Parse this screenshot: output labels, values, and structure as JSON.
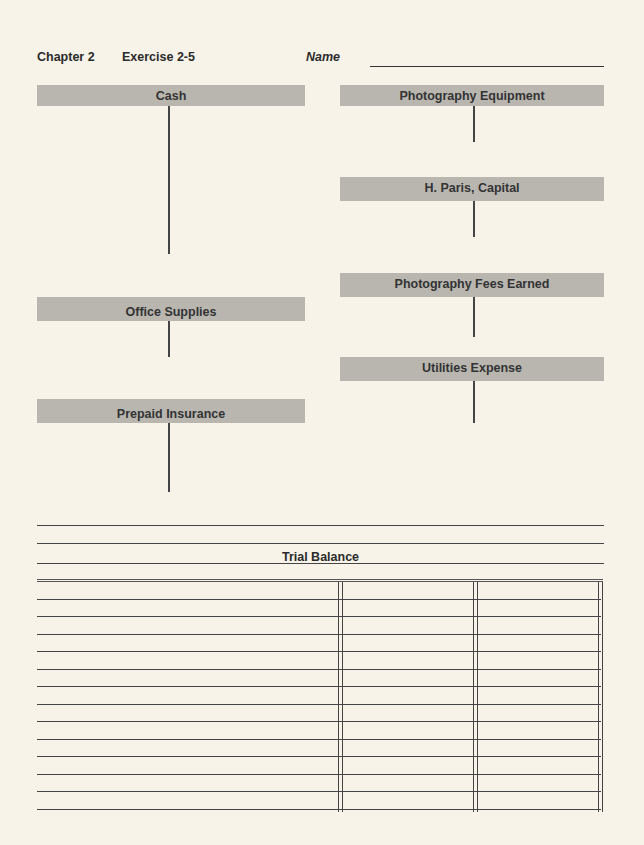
{
  "header": {
    "chapter": "Chapter 2",
    "exercise": "Exercise 2-5",
    "name_label": "Name",
    "name_value": ""
  },
  "t_accounts": {
    "left": [
      {
        "title": "Cash"
      },
      {
        "title": "Office Supplies"
      },
      {
        "title": "Prepaid Insurance"
      }
    ],
    "right": [
      {
        "title": "Photography Equipment"
      },
      {
        "title": "H. Paris, Capital"
      },
      {
        "title": "Photography Fees Earned"
      },
      {
        "title": "Utilities Expense"
      }
    ]
  },
  "trial_balance": {
    "title": "Trial Balance",
    "heading_lines": [
      "",
      ""
    ],
    "columns": [
      "Account",
      "Debit",
      "Credit"
    ],
    "row_count": 13,
    "rows": []
  },
  "colors": {
    "paper": "#f7f3e9",
    "bar": "#b9b6b0",
    "ink": "#2b2b2b"
  }
}
